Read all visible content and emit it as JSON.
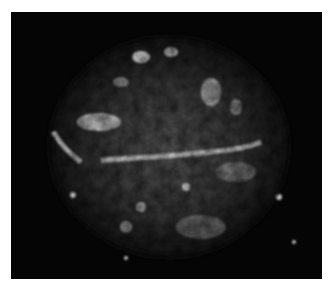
{
  "image": {
    "subject": "nebula",
    "colors": {
      "background": "#050505",
      "border": "#ffffff",
      "glow": "#d8d8d8"
    }
  }
}
